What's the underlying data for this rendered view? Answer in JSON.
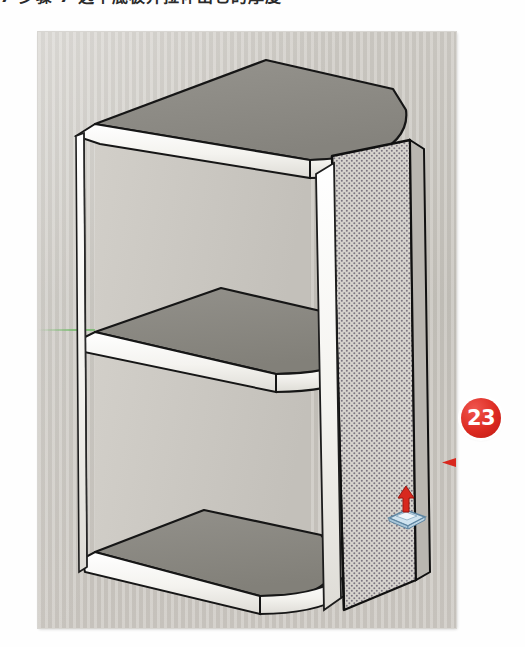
{
  "caption": {
    "text": "7 步骤 7   选中底板并拉伸出它的厚度"
  },
  "figure": {
    "application": "SketchUp",
    "scene_description": "3D open shelf cabinet with three horizontal boards and rounded front-right corners",
    "background_color": "#c9c6c0",
    "board_face_color": "#8f8d87",
    "edge_band_color": "#f6f5f2",
    "outline_color": "#1a1a1a",
    "selection_pattern": "dotted",
    "axis": {
      "name": "green-axis",
      "color": "#6eb964"
    }
  },
  "cursor": {
    "tool": "push-pull-tool",
    "arrow_color": "#d8281e",
    "face_color": "#cfe3ef",
    "face_outline": "#6d93ad"
  },
  "callout": {
    "number": "23",
    "color": "#d8281e",
    "ring_color": "#ffffff",
    "arrow_direction": "left",
    "target": "right-side-panel"
  }
}
